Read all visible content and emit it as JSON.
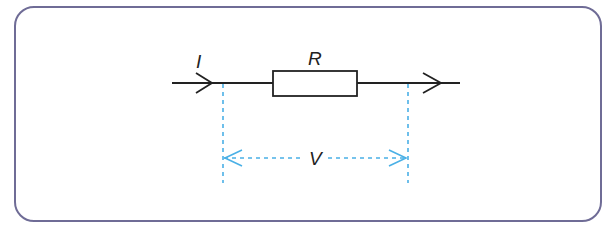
{
  "diagram": {
    "labels": {
      "current": "I",
      "resistor": "R",
      "voltage": "V"
    },
    "colors": {
      "frame": "#6f6c96",
      "wire": "#222222",
      "measurement": "#4ab0e6"
    }
  }
}
